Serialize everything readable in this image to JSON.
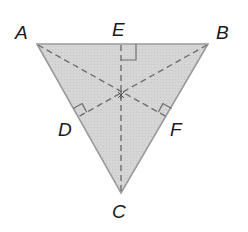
{
  "diagram": {
    "type": "triangle-with-altitudes",
    "fill_color": "#d6d6d6",
    "edge_color": "#9a9a9a",
    "dash_color": "#6e6e6e",
    "vertices": {
      "A": {
        "label": "A",
        "x": 37,
        "y": 44
      },
      "B": {
        "label": "B",
        "x": 208,
        "y": 44
      },
      "C": {
        "label": "C",
        "x": 121,
        "y": 193
      }
    },
    "feet": {
      "D": {
        "label": "D",
        "x": 78,
        "y": 117,
        "on_side": "AC",
        "from": "B"
      },
      "E": {
        "label": "E",
        "x": 121,
        "y": 44,
        "on_side": "AB",
        "from": "C"
      },
      "F": {
        "label": "F",
        "x": 167,
        "y": 117,
        "on_side": "BC",
        "from": "A"
      }
    },
    "intersection_point": {
      "x": 121,
      "y": 95
    },
    "right_angle_marks": [
      "E",
      "D",
      "F"
    ],
    "labels": {
      "A": "A",
      "B": "B",
      "C": "C",
      "D": "D",
      "E": "E",
      "F": "F"
    }
  }
}
